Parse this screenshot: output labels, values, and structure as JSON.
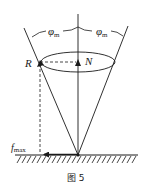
{
  "figure": {
    "caption": "图 5",
    "labels": {
      "angle_left": "φ",
      "angle_left_sub": "m",
      "angle_right": "φ",
      "angle_right_sub": "m",
      "reaction": "R",
      "normal": "N",
      "friction": "f",
      "friction_sub": "max"
    },
    "elements": [
      "vertical-axis",
      "friction-cone-left-edge",
      "friction-cone-right-edge",
      "cone-ellipse",
      "normal-force-arrow",
      "reaction-force-arrow",
      "max-friction-arrow",
      "ground-with-hatching"
    ],
    "colors": {
      "stroke": "#1a1a1a",
      "background": "#ffffff"
    }
  }
}
